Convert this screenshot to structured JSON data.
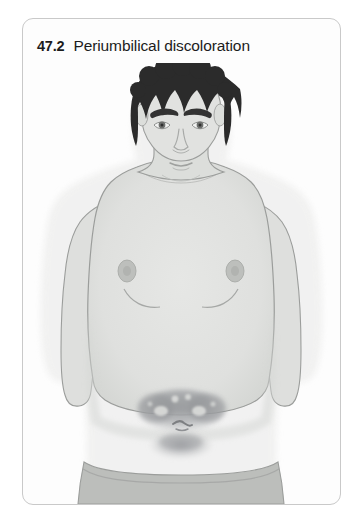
{
  "page": {
    "background_color": "#ffffff"
  },
  "figure_card": {
    "border_color": "#c9c9c9",
    "background_color": "#fdfdfd",
    "caption": {
      "number": "47.2",
      "title": "Periumbilical discoloration"
    }
  },
  "illustration": {
    "subject": "adult-male-torso-frontal-view",
    "description": "Front-facing illustration of a shirtless adult male from head to hips showing periumbilical discoloration around the umbilicus",
    "colors": {
      "skin_fill": "#e3e4e2",
      "skin_shadow": "#d8dad7",
      "skin_outline": "#9b9d9b",
      "hair": "#2b2b2b",
      "eyebrow": "#333333",
      "iris": "#707270",
      "nipple": "#b9bbb8",
      "trousers": "#b9bbb8",
      "trousers_outline": "#9b9d9b",
      "discoloration_dark": "#8f9194",
      "discoloration_mid": "#adafb1",
      "discoloration_light": "#d2d4d2",
      "halo": "#eeefee"
    },
    "parts": [
      {
        "name": "hair",
        "label": "Dark curly hair"
      },
      {
        "name": "face",
        "label": "Face"
      },
      {
        "name": "left-eyebrow",
        "label": "Left eyebrow"
      },
      {
        "name": "right-eyebrow",
        "label": "Right eyebrow"
      },
      {
        "name": "left-eye",
        "label": "Left eye"
      },
      {
        "name": "right-eye",
        "label": "Right eye"
      },
      {
        "name": "nose",
        "label": "Nose"
      },
      {
        "name": "mouth",
        "label": "Mouth"
      },
      {
        "name": "neck",
        "label": "Neck"
      },
      {
        "name": "torso",
        "label": "Torso and abdomen"
      },
      {
        "name": "left-arm",
        "label": "Left arm"
      },
      {
        "name": "right-arm",
        "label": "Right arm"
      },
      {
        "name": "left-nipple",
        "label": "Left nipple"
      },
      {
        "name": "right-nipple",
        "label": "Right nipple"
      },
      {
        "name": "umbilicus",
        "label": "Umbilicus"
      },
      {
        "name": "periumbilical-discoloration",
        "label": "Periumbilical discoloration (Cullen's sign)"
      },
      {
        "name": "trousers",
        "label": "Trousers waistband"
      }
    ]
  }
}
